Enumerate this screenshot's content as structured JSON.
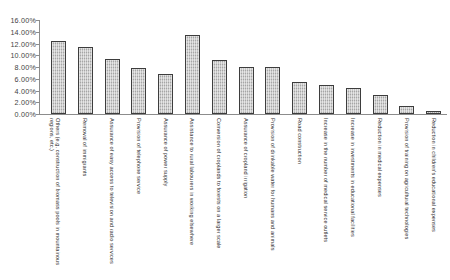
{
  "chart_data": {
    "type": "bar",
    "title": "",
    "xlabel": "",
    "ylabel": "",
    "ylim": [
      0,
      16
    ],
    "grid": false,
    "legend": "none",
    "y_tick_labels": [
      "16.00%",
      "14.00%",
      "12.00%",
      "10.00%",
      "8.00%",
      "6.00%",
      "4.00%",
      "2.00%",
      "0.00%"
    ],
    "y_tick_values": [
      16,
      14,
      12,
      10,
      8,
      6,
      4,
      2,
      0
    ],
    "categories": [
      "Others (e.g. construction of biomass pools in mountainous regions, etc.)",
      "Removal of immigrants",
      "Assurance of easy access to television and radio services",
      "Provision of telephone service",
      "Assurance of power supply",
      "Assistance to rural labourers in working elsewhere",
      "Conversion of croplands to forests on a larger scale",
      "Assurance of cropland irrigation",
      "Provision of drinkable water for humans and animals",
      "Road construction",
      "Increase in the number of medical service outlets",
      "Increase in investments in educational facilities",
      "Reduction in medical expenses",
      "Provision of training on agricultural technologies",
      "Reduction in children's educational expenses"
    ],
    "values": [
      12.4,
      11.4,
      9.4,
      7.8,
      6.8,
      13.4,
      9.2,
      8.0,
      8.0,
      5.4,
      5.0,
      4.4,
      3.3,
      1.4,
      0.5
    ],
    "bar_color": "#b9b9b9",
    "bar_border_color": "#3d3d3d",
    "axis_color": "#8c8c8c"
  }
}
